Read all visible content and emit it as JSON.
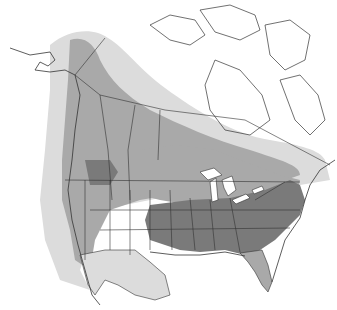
{
  "map": {
    "title": "Range map of North America",
    "legend": [],
    "colors": {
      "background": "#ffffff",
      "land": "#ffffff",
      "light_range": "#dcdcdc",
      "medium_range": "#a9a9a9",
      "dark_range": "#7a7a7a",
      "borders": "#333333",
      "water": "#ffffff"
    }
  }
}
